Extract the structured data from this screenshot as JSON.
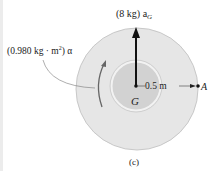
{
  "figure": {
    "label_force": "(8 kg) a",
    "label_force_sub": "G",
    "label_moment": "(0.980 kg · m",
    "label_moment_sup": "2",
    "label_moment_end": ") α",
    "label_center": "G",
    "label_radius": "0.5 m",
    "label_point": "A",
    "caption": "(c)"
  },
  "colors": {
    "outer_disk": "#e6e6e6",
    "outer_rim": "#c8c8c8",
    "inner_disk": "#d2d2d2",
    "inner_rim": "#eeeeee",
    "arrow": "#111111",
    "moment_arrow": "#666666"
  }
}
